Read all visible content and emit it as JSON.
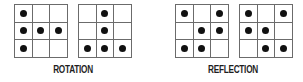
{
  "colors": {
    "grid_line": "#6b6b6b",
    "dot": "#111111",
    "label": "#1e1e1e",
    "background": "#ffffff"
  },
  "groups": [
    {
      "label": "ROTATION",
      "grids": [
        {
          "cells": [
            [
              1,
              0,
              0
            ],
            [
              1,
              1,
              1
            ],
            [
              1,
              0,
              0
            ]
          ]
        },
        {
          "cells": [
            [
              0,
              1,
              0
            ],
            [
              0,
              1,
              0
            ],
            [
              1,
              1,
              1
            ]
          ]
        }
      ]
    },
    {
      "label": "REFLECTION",
      "grids": [
        {
          "cells": [
            [
              1,
              0,
              1
            ],
            [
              0,
              1,
              1
            ],
            [
              1,
              1,
              0
            ]
          ]
        },
        {
          "cells": [
            [
              1,
              0,
              1
            ],
            [
              1,
              1,
              0
            ],
            [
              0,
              1,
              1
            ]
          ]
        }
      ]
    }
  ]
}
